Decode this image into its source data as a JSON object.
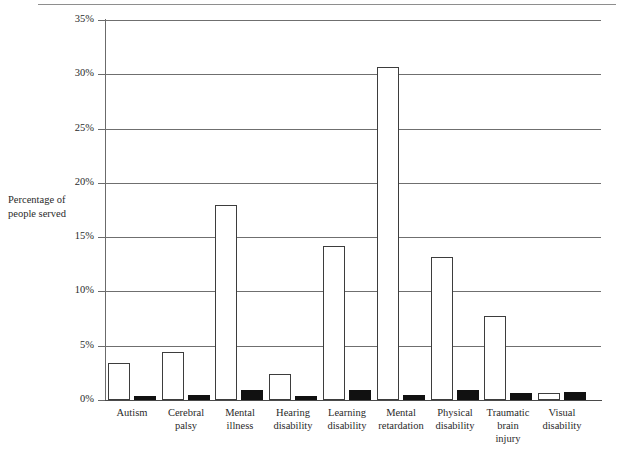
{
  "figure": {
    "axis_title": "Percentage of\npeople served",
    "value_suffix": "%"
  },
  "chart_data": {
    "type": "bar",
    "title": "",
    "subtitle": "",
    "xlabel": "",
    "ylabel": "Percentage of people served",
    "ylim": [
      0,
      35
    ],
    "ytick_labels": [
      "0%",
      "5%",
      "10%",
      "15%",
      "20%",
      "25%",
      "30%",
      "35%"
    ],
    "ytick_values": [
      0,
      5,
      10,
      15,
      20,
      25,
      30,
      35
    ],
    "grid": true,
    "grid_axis": "y",
    "legend": false,
    "legend_position": "none",
    "categories": [
      "Autism",
      "Cerebral palsy",
      "Mental illness",
      "Hearing disability",
      "Learning disability",
      "Mental retardation",
      "Physical disability",
      "Traumatic brain injury",
      "Visual disability"
    ],
    "category_label_lines": [
      [
        "Autism"
      ],
      [
        "Cerebral",
        "palsy"
      ],
      [
        "Mental",
        "illness"
      ],
      [
        "Hearing",
        "disability"
      ],
      [
        "Learning",
        "disability"
      ],
      [
        "Mental",
        "retardation"
      ],
      [
        "Physical",
        "disability"
      ],
      [
        "Traumatic",
        "brain",
        "injury"
      ],
      [
        "Visual",
        "disability"
      ]
    ],
    "series": [
      {
        "name": "white-bar-series",
        "fill": "#ffffff",
        "edge": "#3d3d3d",
        "values": [
          3.4,
          4.4,
          18.0,
          2.4,
          14.2,
          30.7,
          13.2,
          7.7,
          0.6
        ]
      },
      {
        "name": "black-bar-series",
        "fill": "#111111",
        "edge": "#111111",
        "values": [
          0.4,
          0.5,
          0.9,
          0.4,
          0.9,
          0.5,
          0.9,
          0.6,
          0.7
        ]
      }
    ]
  }
}
